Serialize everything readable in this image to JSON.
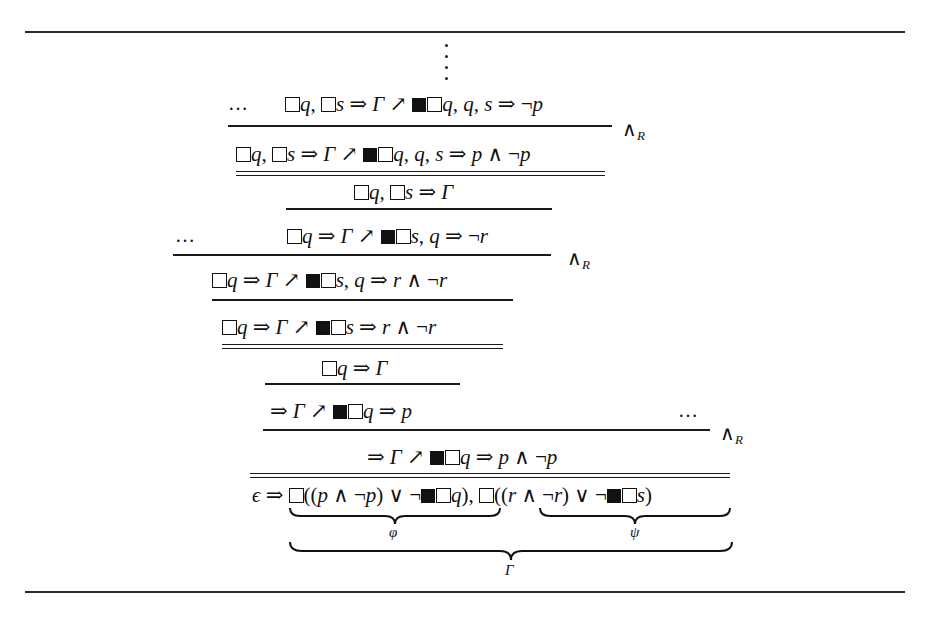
{
  "figure": {
    "type": "sequent-calculus-proof-tree",
    "ellipsis": "…",
    "rule_label": "∧",
    "rule_label_sub": "R",
    "lines": [
      {
        "id": "s1",
        "parts": [
          "□",
          "q, ",
          "□",
          "s ⇒ Γ ↗ ",
          "■",
          "□",
          "q, q, s ⇒ ¬p"
        ],
        "plain": "□q, □s ⇒ Γ ↗ ■□q, q, s ⇒ ¬p"
      },
      {
        "id": "s2",
        "plain": "□q, □s ⇒ Γ ↗ ■□q, q, s ⇒ p ∧ ¬p"
      },
      {
        "id": "s3",
        "plain": "□q, □s ⇒ Γ"
      },
      {
        "id": "s4",
        "plain": "□q ⇒ Γ ↗ ■□s, q ⇒ ¬r"
      },
      {
        "id": "s5",
        "plain": "□q ⇒ Γ ↗ ■□s, q ⇒ r ∧ ¬r"
      },
      {
        "id": "s6",
        "plain": "□q ⇒ Γ ↗ ■□s ⇒ r ∧ ¬r"
      },
      {
        "id": "s7",
        "plain": "□q ⇒ Γ"
      },
      {
        "id": "s8",
        "plain": "⇒ Γ ↗ ■□q ⇒ p"
      },
      {
        "id": "s9",
        "plain": "⇒ Γ ↗ ■□q ⇒ p ∧ ¬p"
      },
      {
        "id": "s10",
        "plain": "ϵ ⇒ □((p ∧ ¬p) ∨ ¬■□q), □((r ∧ ¬r) ∨ ¬■□s)"
      }
    ],
    "braces": {
      "phi": "φ",
      "psi": "ψ",
      "gamma": "Γ"
    },
    "t": {
      "eps": "ϵ",
      "imp": "⇒",
      "G": "Γ",
      "nearr": "↗",
      "q": "q",
      "s": "s",
      "p": "p",
      "r": "r",
      "comma": ",",
      "and": "∧",
      "or": "∨",
      "neg": "¬",
      "lp": "(",
      "rp": ")"
    }
  }
}
